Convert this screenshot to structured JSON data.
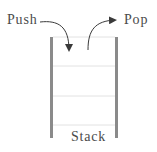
{
  "diagram": {
    "labels": {
      "push": "Push",
      "pop": "Pop",
      "stack": "Stack"
    },
    "colors": {
      "walls": "#8a8a8a",
      "slots": "#e2e2e2",
      "arrows": "#3a3a3a",
      "text": "#4a4a4a"
    },
    "stack": {
      "slot_count": 3
    }
  }
}
